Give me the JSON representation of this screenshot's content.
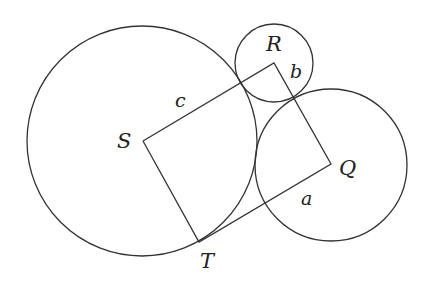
{
  "diagram": {
    "type": "geometry",
    "colors": {
      "stroke": "#333333",
      "text": "#222222",
      "background": "#ffffff"
    },
    "circles": [
      {
        "name": "circle-S",
        "cx": 142,
        "cy": 141,
        "r": 115
      },
      {
        "name": "circle-R",
        "cx": 274,
        "cy": 63,
        "r": 39
      },
      {
        "name": "circle-Q",
        "cx": 331,
        "cy": 165,
        "r": 76
      }
    ],
    "vertices": {
      "S": {
        "label": "S",
        "x": 143,
        "y": 141
      },
      "R": {
        "label": "R",
        "x": 274,
        "y": 63
      },
      "Q": {
        "label": "Q",
        "x": 331,
        "y": 164
      },
      "T": {
        "label": "T",
        "x": 199,
        "y": 242
      }
    },
    "edges": [
      {
        "from": "S",
        "to": "R",
        "label": "c"
      },
      {
        "from": "R",
        "to": "Q",
        "label": "b"
      },
      {
        "from": "Q",
        "to": "T",
        "label": "a"
      },
      {
        "from": "T",
        "to": "S",
        "label": ""
      }
    ],
    "labels": {
      "S": "S",
      "R": "R",
      "Q": "Q",
      "T": "T",
      "a": "a",
      "b": "b",
      "c": "c"
    }
  }
}
